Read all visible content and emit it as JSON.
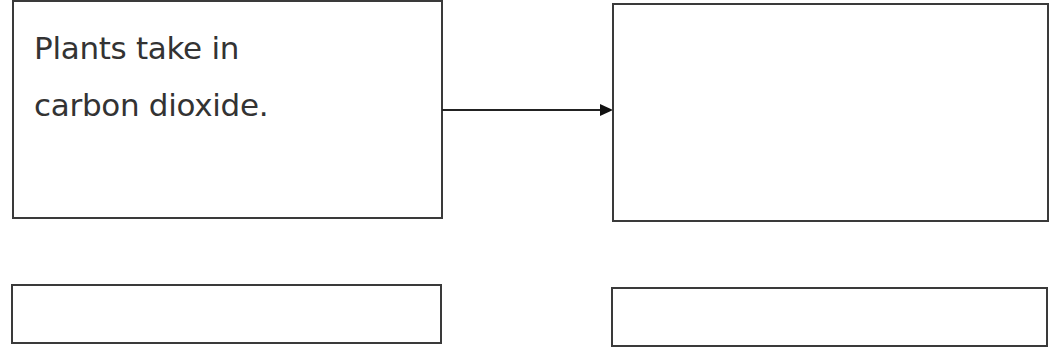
{
  "diagram": {
    "type": "flow",
    "boxes": [
      {
        "id": "box-1",
        "text": "Plants take in carbon dioxide.",
        "lines": [
          "Plants take in",
          "carbon dioxide."
        ]
      },
      {
        "id": "box-2",
        "text": ""
      },
      {
        "id": "box-3",
        "text": ""
      },
      {
        "id": "box-4",
        "text": ""
      }
    ],
    "connectors": [
      {
        "from": "box-1",
        "to": "box-2",
        "style": "arrow"
      }
    ],
    "colors": {
      "border": "#3a3a3a",
      "text": "#333333",
      "arrow": "#111111",
      "background": "#ffffff"
    }
  }
}
